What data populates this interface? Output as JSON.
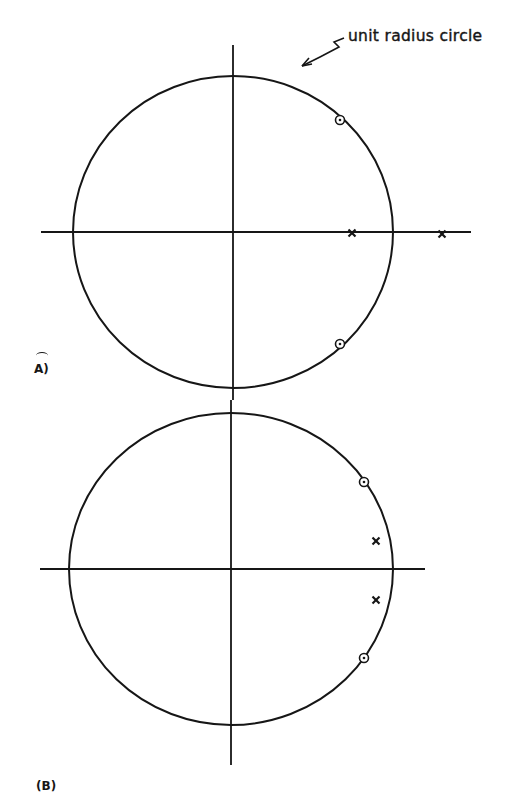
{
  "annotation": {
    "text": "unit radius circle"
  },
  "panels": [
    {
      "label": "A)",
      "circle": {
        "cx": 233,
        "cy": 232,
        "rx": 160,
        "ry": 156
      },
      "axes": {
        "h_x1": 41,
        "h_x2": 471,
        "v_y1": 45,
        "v_y2": 400
      },
      "zeros": [
        {
          "x": 340,
          "y": 120
        },
        {
          "x": 340,
          "y": 344
        }
      ],
      "poles": [
        {
          "x": 352,
          "y": 233
        },
        {
          "x": 442,
          "y": 234
        }
      ]
    },
    {
      "label": "(B)",
      "circle": {
        "cx": 231,
        "cy": 569,
        "rx": 162,
        "ry": 156
      },
      "axes": {
        "h_x1": 40,
        "h_x2": 425,
        "v_y1": 400,
        "v_y2": 765
      },
      "zeros": [
        {
          "x": 364,
          "y": 482
        },
        {
          "x": 364,
          "y": 658
        }
      ],
      "poles": [
        {
          "x": 376,
          "y": 541
        },
        {
          "x": 376,
          "y": 600
        }
      ]
    }
  ],
  "colors": {
    "ink": "#161616",
    "background": "#ffffff"
  }
}
